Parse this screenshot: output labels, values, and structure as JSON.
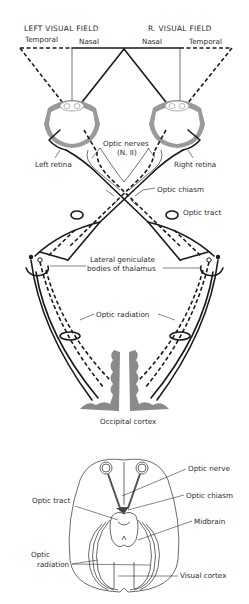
{
  "figure": {
    "top_diagram": {
      "left_field": {
        "heading": "LEFT VISUAL FIELD",
        "temporal": "Temporal",
        "nasal": "Nasal"
      },
      "right_field": {
        "heading": "R. VISUAL FIELD",
        "nasal": "Nasal",
        "temporal": "Temporal"
      },
      "labels": {
        "optic_nerves_line1": "Optic nerves",
        "optic_nerves_line2": "(N. II)",
        "left_retina": "Left retina",
        "right_retina": "Right retina",
        "optic_chiasm": "Optic chiasm",
        "optic_tract": "Optic tract",
        "lgb_line1": "Lateral geniculate",
        "lgb_line2": "bodies of thalamus",
        "optic_radiation": "Optic radiation",
        "occipital_cortex": "Occipital cortex"
      }
    },
    "bottom_diagram": {
      "labels": {
        "optic_nerve": "Optic nerve",
        "optic_tract": "Optic tract",
        "optic_chiasm": "Optic chiasm",
        "midbrain": "Midbrain",
        "optic_radiation_line1": "Optic",
        "optic_radiation_line2": "radiation",
        "visual_cortex": "Visual cortex"
      }
    }
  }
}
